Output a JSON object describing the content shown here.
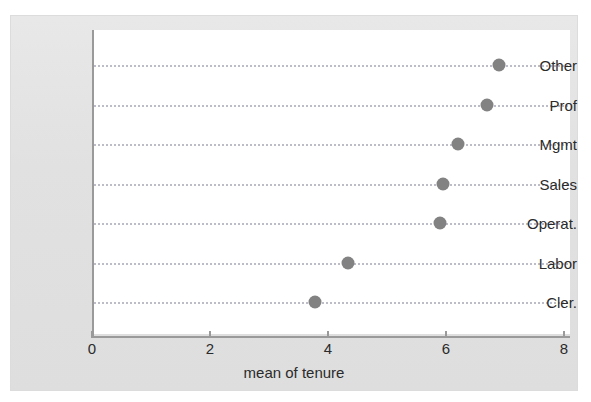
{
  "chart_data": {
    "type": "scatter",
    "orientation": "horizontal",
    "title": "",
    "subtitle": "",
    "xlabel": "mean of tenure",
    "ylabel": "",
    "categories": [
      "Other",
      "Prof",
      "Mgmt",
      "Sales",
      "Operat.",
      "Labor",
      "Cler."
    ],
    "values": [
      6.9,
      6.7,
      6.2,
      5.95,
      5.9,
      4.34,
      3.78
    ],
    "series": [
      {
        "name": "mean of tenure",
        "values": [
          6.9,
          6.7,
          6.2,
          5.95,
          5.9,
          4.34,
          3.78
        ]
      }
    ],
    "points": [
      {
        "category": "Other",
        "value": 6.9
      },
      {
        "category": "Prof",
        "value": 6.7
      },
      {
        "category": "Mgmt",
        "value": 6.2
      },
      {
        "category": "Sales",
        "value": 5.95
      },
      {
        "category": "Operat.",
        "value": 5.9
      },
      {
        "category": "Labor",
        "value": 4.34
      },
      {
        "category": "Cler.",
        "value": 3.78
      }
    ],
    "xlim": [
      0,
      8
    ],
    "xticks": [
      0,
      2,
      4,
      6,
      8
    ],
    "xtick_labels": [
      "0",
      "2",
      "4",
      "6",
      "8"
    ],
    "yticks": [
      "Other",
      "Prof",
      "Mgmt",
      "Sales",
      "Operat.",
      "Labor",
      "Cler."
    ],
    "grid": true,
    "grid_axis": "y",
    "grid_style": "dotted",
    "legend": null,
    "legend_position": "none",
    "annotations": [],
    "marker": "circle",
    "marker_color": "#828282",
    "grid_color": "#bdbdc8",
    "axis_color": "#9a9a9a",
    "plot_background": "#ffffff",
    "figure_background": "#e3e3e3",
    "text_color": "#2b2b2b"
  }
}
